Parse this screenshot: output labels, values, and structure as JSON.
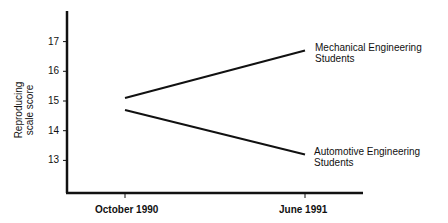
{
  "chart_data": {
    "type": "line",
    "title": "",
    "xlabel": "",
    "ylabel": "Reproducing scale score",
    "ylabel_lines": [
      "Reproducing",
      "scale score"
    ],
    "categories": [
      "October 1990",
      "June 1991"
    ],
    "yticks": [
      13,
      14,
      15,
      16,
      17
    ],
    "ylim": [
      12,
      18.5
    ],
    "grid": false,
    "legend_position": "inline-right",
    "series": [
      {
        "name": "Mechanical Engineering Students",
        "label_lines": [
          "Mechanical Engineering",
          "Students"
        ],
        "values": [
          15.1,
          16.7
        ]
      },
      {
        "name": "Automotive Engineering Students",
        "label_lines": [
          "Automotive Engineering",
          "Students"
        ],
        "values": [
          14.7,
          13.2
        ]
      }
    ]
  }
}
